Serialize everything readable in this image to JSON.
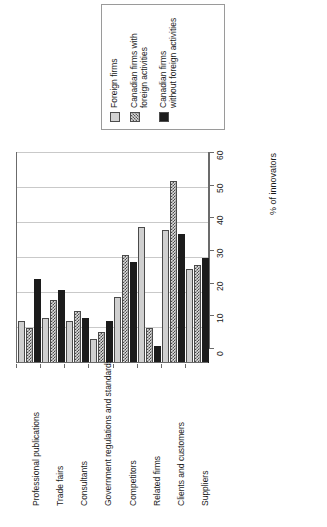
{
  "chart_data": {
    "type": "bar",
    "title": "",
    "orientation": "rotated-90",
    "xlabel": "",
    "ylabel": "% of innovators",
    "ylim": [
      0,
      60
    ],
    "yticks": [
      0,
      10,
      20,
      30,
      40,
      50,
      60
    ],
    "grid": true,
    "legend_position": "top",
    "categories": [
      "Professional publications",
      "Trade fairs",
      "Consultants",
      "Government regulations and standards",
      "Competitors",
      "Related firms",
      "Clients and customers",
      "Suppliers"
    ],
    "series": [
      {
        "name": "Foreign firms",
        "swatch": "light",
        "color": "#cfcfcf",
        "values": [
          12,
          13,
          12,
          7,
          19,
          39,
          38,
          27
        ]
      },
      {
        "name": "Canadian firms with foreign activities",
        "swatch": "hatched",
        "color": "#dcdcdc",
        "values": [
          10,
          18,
          15,
          9,
          31,
          10,
          52,
          28
        ]
      },
      {
        "name": "Canadian firms without foreign activities",
        "swatch": "dark",
        "color": "#1c1c1c",
        "values": [
          24,
          21,
          13,
          12,
          29,
          5,
          37,
          30
        ]
      }
    ]
  },
  "legend": {
    "items": [
      {
        "label": "Foreign firms",
        "swatch": "light"
      },
      {
        "label": "Canadian firms with\nforeign activities",
        "swatch": "hatched"
      },
      {
        "label": "Canadian firms\nwithout foreign activities",
        "swatch": "dark"
      }
    ]
  },
  "axis": {
    "y_title": "% of innovators",
    "ticks": [
      "0",
      "10",
      "20",
      "30",
      "40",
      "50",
      "60"
    ]
  }
}
